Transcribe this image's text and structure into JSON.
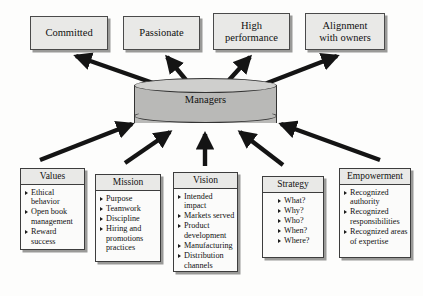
{
  "diagram": {
    "center": {
      "label": "Managers",
      "shape": "cylinder"
    },
    "outcomes": [
      {
        "id": "committed",
        "lines": [
          "Committed"
        ]
      },
      {
        "id": "passionate",
        "lines": [
          "Passionate"
        ]
      },
      {
        "id": "high-performance",
        "lines": [
          "High",
          "performance"
        ]
      },
      {
        "id": "alignment",
        "lines": [
          "Alignment",
          "with owners"
        ]
      }
    ],
    "drivers": [
      {
        "id": "values",
        "title": "Values",
        "items": [
          "Ethical behavior",
          "Open book management",
          "Reward success"
        ]
      },
      {
        "id": "mission",
        "title": "Mission",
        "items": [
          "Purpose",
          "Teamwork",
          "Discipline",
          "Hiring and promotions practices"
        ]
      },
      {
        "id": "vision",
        "title": "Vision",
        "items": [
          "Intended impact",
          "Markets served",
          "Product development",
          "Manufacturing",
          "Distribution channels"
        ]
      },
      {
        "id": "strategy",
        "title": "Strategy",
        "items": [
          "What?",
          "Why?",
          "Who?",
          "When?",
          "Where?"
        ]
      },
      {
        "id": "empowerment",
        "title": "Empowerment",
        "items": [
          "Recognized authority",
          "Recognized responsibilities",
          "Recognized areas of expertise"
        ]
      }
    ],
    "colors": {
      "box_fill": "#e9e9e7",
      "panel_fill": "#fbfbfa",
      "cylinder_fill": "#b9b9b7",
      "cylinder_top": "#cfcfcd",
      "outline": "#3d3d3d",
      "arrow": "#141414",
      "shadow": "#9a9a98",
      "background": "#fdfdfc"
    }
  }
}
